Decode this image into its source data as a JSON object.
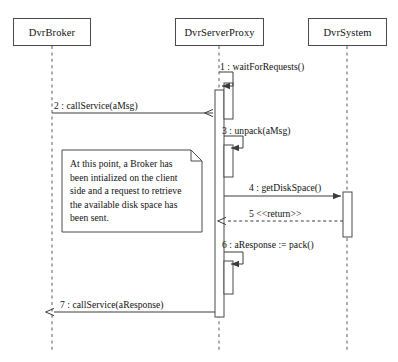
{
  "diagram": {
    "kind": "uml-sequence-diagram",
    "width": 398,
    "height": 362,
    "background_color": "#ffffff",
    "line_color": "#4a4a4a",
    "text_color": "#111111"
  },
  "lifelines": [
    {
      "name": "DvrBroker",
      "label": "DvrBroker",
      "x": 52,
      "box": {
        "left": 13,
        "top": 18,
        "width": 78,
        "height": 28
      }
    },
    {
      "name": "DvrServerProxy",
      "label": "DvrServerProxy",
      "x": 219,
      "box": {
        "left": 175,
        "top": 18,
        "width": 89,
        "height": 28
      }
    },
    {
      "name": "DvrSystem",
      "label": "DvrSystem",
      "x": 347,
      "box": {
        "left": 308,
        "top": 18,
        "width": 79,
        "height": 28
      }
    }
  ],
  "messages": [
    {
      "seq": "1",
      "label": "1 : waitForRequests()",
      "kind": "self-call",
      "from": "DvrServerProxy",
      "to": "DvrServerProxy",
      "y": 67,
      "label_x": 220,
      "label_y": 61
    },
    {
      "seq": "2",
      "label": "2 : callService(aMsg)",
      "kind": "call",
      "from": "DvrBroker",
      "to": "DvrServerProxy",
      "y": 113,
      "label_x": 54,
      "label_y": 100
    },
    {
      "seq": "3",
      "label": "3 : unpack(aMsg)",
      "kind": "self-call",
      "from": "DvrServerProxy",
      "to": "DvrServerProxy",
      "y": 131,
      "label_x": 222,
      "label_y": 125
    },
    {
      "seq": "4",
      "label": "4 : getDiskSpace()",
      "kind": "call",
      "from": "DvrServerProxy",
      "to": "DvrSystem",
      "y": 196,
      "label_x": 249,
      "label_y": 182
    },
    {
      "seq": "5",
      "label": "5 <<return>>",
      "kind": "return",
      "from": "DvrSystem",
      "to": "DvrServerProxy",
      "y": 221,
      "label_x": 249,
      "label_y": 208
    },
    {
      "seq": "6",
      "label": "6 : aResponse := pack()",
      "kind": "self-call",
      "from": "DvrServerProxy",
      "to": "DvrServerProxy",
      "y": 251,
      "label_x": 222,
      "label_y": 239
    },
    {
      "seq": "7",
      "label": "7 : callService(aResponse)",
      "kind": "call",
      "from": "DvrServerProxy",
      "to": "DvrBroker",
      "y": 312,
      "label_x": 60,
      "label_y": 299
    }
  ],
  "activations": [
    {
      "name": "proxy-main-activation",
      "owner": "DvrServerProxy",
      "left": 215,
      "top": 90,
      "width": 9,
      "height": 227
    },
    {
      "name": "proxy-activation-wait",
      "owner": "DvrServerProxy",
      "left": 224,
      "top": 83,
      "width": 9,
      "height": 36
    },
    {
      "name": "proxy-activation-unpack",
      "owner": "DvrServerProxy",
      "left": 224,
      "top": 145,
      "width": 9,
      "height": 32
    },
    {
      "name": "proxy-activation-pack",
      "owner": "DvrServerProxy",
      "left": 224,
      "top": 261,
      "width": 9,
      "height": 33
    },
    {
      "name": "system-activation",
      "owner": "DvrSystem",
      "left": 343,
      "top": 192,
      "width": 9,
      "height": 45
    }
  ],
  "note": {
    "name": "broker-note",
    "box": {
      "left": 62,
      "top": 150,
      "width": 140,
      "height": 82
    },
    "fold_size": 11,
    "anchor": {
      "x": 121,
      "y": 116
    },
    "lines": [
      "At this point, a Broker has",
      "been intialized on the client",
      "side and a request to retrieve",
      "the available disk space has",
      "been sent."
    ]
  }
}
